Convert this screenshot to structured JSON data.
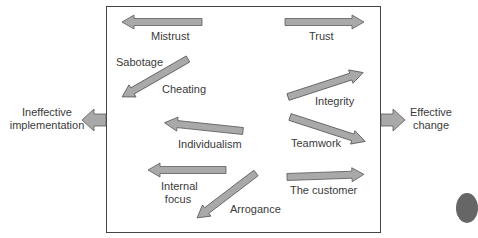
{
  "diagram": {
    "outcomes": {
      "left": {
        "line1": "Ineffective",
        "line2": "implementation"
      },
      "right": {
        "line1": "Effective",
        "line2": "change"
      }
    },
    "negative_forces": [
      {
        "label": "Mistrust"
      },
      {
        "label_a": "Sabotage",
        "label_b": "Cheating"
      },
      {
        "label": "Individualism"
      },
      {
        "line1": "Internal",
        "line2": "focus"
      },
      {
        "label": "Arrogance"
      }
    ],
    "positive_forces": [
      {
        "label": "Trust"
      },
      {
        "label": "Integrity"
      },
      {
        "label": "Teamwork"
      },
      {
        "label": "The customer"
      }
    ],
    "colors": {
      "arrow_fill": "#a9a9a9",
      "arrow_stroke": "#5a5a5a",
      "box_border": "#444444",
      "text": "#3a3a3a"
    }
  }
}
